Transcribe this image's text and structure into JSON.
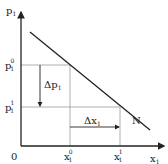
{
  "diagram": {
    "type": "demand-curve",
    "y_axis_label": "p",
    "y_axis_sub": "1",
    "x_axis_label": "x",
    "x_axis_sub": "1",
    "origin_label": "0",
    "curve_label": "N",
    "price_levels": [
      {
        "label": "p",
        "sub": "1",
        "sup": "0"
      },
      {
        "label": "p",
        "sub": "1",
        "sup": "1"
      }
    ],
    "quantity_levels": [
      {
        "label": "x",
        "sub": "1",
        "sup": "0"
      },
      {
        "label": "x",
        "sub": "1",
        "sup": "1"
      }
    ],
    "delta_p_label": "Δp",
    "delta_p_sub": "1",
    "delta_x_label": "Δx",
    "delta_x_sub": "1",
    "colors": {
      "axis": "#222222",
      "curve": "#222222",
      "guides": "#999999"
    }
  }
}
